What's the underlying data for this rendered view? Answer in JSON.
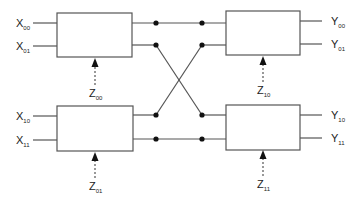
{
  "diagram": {
    "type": "butterfly switching network",
    "blocks": [
      {
        "id": "top-left",
        "inputs": [
          "X00",
          "X01"
        ],
        "control": "Z00"
      },
      {
        "id": "bottom-left",
        "inputs": [
          "X10",
          "X11"
        ],
        "control": "Z01"
      },
      {
        "id": "top-right",
        "outputs": [
          "Y00",
          "Y01"
        ],
        "control": "Z10"
      },
      {
        "id": "bottom-right",
        "outputs": [
          "Y10",
          "Y11"
        ],
        "control": "Z11"
      }
    ],
    "labels": {
      "x00": {
        "base": "X",
        "sub": "00"
      },
      "x01": {
        "base": "X",
        "sub": "01"
      },
      "x10": {
        "base": "X",
        "sub": "10"
      },
      "x11": {
        "base": "X",
        "sub": "11"
      },
      "y00": {
        "base": "Y",
        "sub": "00"
      },
      "y01": {
        "base": "Y",
        "sub": "01"
      },
      "y10": {
        "base": "Y",
        "sub": "10"
      },
      "y11": {
        "base": "Y",
        "sub": "11"
      },
      "z00": {
        "base": "Z",
        "sub": "00"
      },
      "z01": {
        "base": "Z",
        "sub": "01"
      },
      "z10": {
        "base": "Z",
        "sub": "10"
      },
      "z11": {
        "base": "Z",
        "sub": "11"
      }
    },
    "connections": [
      "top-left.out0 -> top-right.in0",
      "top-left.out1 -> bottom-right.in0",
      "bottom-left.out0 -> top-right.in1",
      "bottom-left.out1 -> bottom-right.in1"
    ]
  }
}
